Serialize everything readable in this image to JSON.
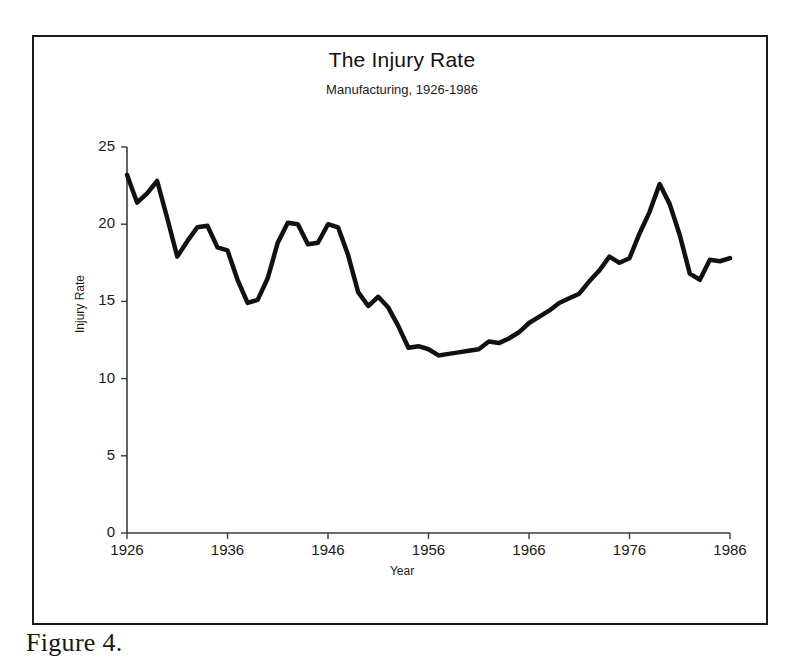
{
  "figure": {
    "caption": "Figure 4."
  },
  "chart_data": {
    "type": "line",
    "title": "The Injury Rate",
    "subtitle": "Manufacturing, 1926-1986",
    "xlabel": "Year",
    "ylabel": "Injury Rate",
    "xlim": [
      1926,
      1986
    ],
    "ylim": [
      0,
      25
    ],
    "grid": false,
    "legend": false,
    "xticks": [
      1926,
      1936,
      1946,
      1956,
      1966,
      1976,
      1986
    ],
    "xtick_labels": [
      "1926",
      "1936",
      "1946",
      "1956",
      "1966",
      "1976",
      "1986"
    ],
    "yticks": [
      0,
      5,
      10,
      15,
      20,
      25
    ],
    "ytick_labels": [
      "0",
      "5",
      "10",
      "15",
      "20",
      "25"
    ],
    "line_color": "#111111",
    "line_width": 4.5,
    "x": [
      1926,
      1927,
      1928,
      1929,
      1930,
      1931,
      1932,
      1933,
      1934,
      1935,
      1936,
      1937,
      1938,
      1939,
      1940,
      1941,
      1942,
      1943,
      1944,
      1945,
      1946,
      1947,
      1948,
      1949,
      1950,
      1951,
      1952,
      1953,
      1954,
      1955,
      1956,
      1957,
      1958,
      1959,
      1960,
      1961,
      1962,
      1963,
      1964,
      1965,
      1966,
      1967,
      1968,
      1969,
      1970,
      1971,
      1972,
      1973,
      1974,
      1975,
      1976,
      1977,
      1978,
      1979,
      1980,
      1981,
      1982,
      1983,
      1984,
      1985,
      1986
    ],
    "values": [
      23.2,
      21.4,
      22.0,
      22.8,
      20.4,
      17.9,
      18.9,
      19.8,
      19.9,
      18.5,
      18.3,
      16.4,
      14.9,
      15.1,
      16.5,
      18.8,
      20.1,
      20.0,
      18.7,
      18.8,
      20.0,
      19.8,
      18.0,
      15.6,
      14.7,
      15.3,
      14.6,
      13.4,
      12.0,
      12.1,
      11.9,
      11.5,
      11.6,
      11.7,
      11.8,
      11.9,
      12.4,
      12.3,
      12.6,
      13.0,
      13.6,
      14.0,
      14.4,
      14.9,
      15.2,
      15.5,
      16.3,
      17.0,
      17.9,
      17.5,
      17.8,
      19.4,
      20.8,
      22.6,
      21.3,
      19.3,
      16.8,
      16.4,
      17.7,
      17.6,
      17.8
    ]
  }
}
